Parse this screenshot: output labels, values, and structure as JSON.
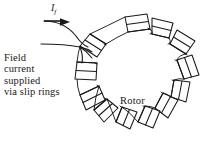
{
  "figure": {
    "background_color": "#ffffff",
    "ink_color": "#1a1a1a",
    "width": 213,
    "height": 144
  },
  "annotations": {
    "field_current_symbol": "I",
    "field_current_subscript": "f",
    "rotor_label": "Rotor",
    "description_lines": [
      "Field",
      "current",
      "supplied",
      "via slip rings"
    ]
  },
  "rotor": {
    "center_x": 138,
    "center_y": 72,
    "radius": 40,
    "pole_count": 12,
    "pole_inner_radius": 40,
    "pole_outer_radius": 56
  },
  "leads": {
    "count": 2,
    "arrow_direction": "right"
  }
}
